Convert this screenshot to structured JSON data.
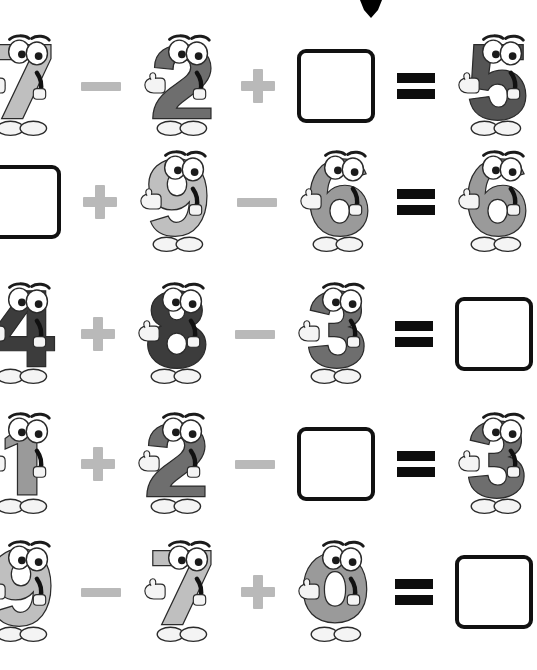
{
  "worksheet": {
    "title": "Number characters addition and subtraction worksheet",
    "background_color": "#ffffff",
    "cursor": {
      "name": "down-triangle-cursor",
      "color": "#000000"
    }
  },
  "symbols": {
    "plus": "+",
    "minus": "−",
    "equals": "=",
    "blank": "",
    "plus_color": "#b9b9b9",
    "minus_color": "#b9b9b9",
    "equals_color": "#0d0d0d",
    "box_border_color": "#111111",
    "box_fill_color": "#ffffff"
  },
  "digit_colors": {
    "light": "#bfbfbf",
    "medium": "#9a9a9a",
    "dark": "#6e6e6e",
    "darker": "#555555",
    "near_black": "#3c3c3c",
    "outline": "#2b2b2b",
    "shoe": "#f4f4f4",
    "hand": "#f4f4f4"
  },
  "chart_data": {
    "type": "table",
    "columns": [
      "operand1",
      "operator1",
      "operand2",
      "operator2",
      "operand3",
      "equals",
      "result"
    ],
    "rows": [
      [
        "7",
        "−",
        "2",
        "+",
        "",
        "=",
        "5"
      ],
      [
        "",
        "+",
        "9",
        "−",
        "6",
        "=",
        "6"
      ],
      [
        "4",
        "+",
        "8",
        "−",
        "3",
        "=",
        ""
      ],
      [
        "1",
        "+",
        "2",
        "−",
        "",
        "=",
        "3"
      ],
      [
        "9",
        "−",
        "7",
        "+",
        "0",
        "=",
        ""
      ]
    ]
  },
  "equations": [
    {
      "index": 1,
      "top": 34,
      "terms": [
        {
          "kind": "digit",
          "value": "7",
          "shade": "light",
          "name": "digit-7"
        },
        {
          "kind": "op",
          "value": "−",
          "name": "minus-operator"
        },
        {
          "kind": "digit",
          "value": "2",
          "shade": "dark",
          "name": "digit-2"
        },
        {
          "kind": "op",
          "value": "+",
          "name": "plus-operator"
        },
        {
          "kind": "box",
          "value": "",
          "name": "answer-box"
        },
        {
          "kind": "op",
          "value": "=",
          "name": "equals-operator"
        },
        {
          "kind": "digit",
          "value": "5",
          "shade": "darker",
          "name": "digit-5"
        }
      ]
    },
    {
      "index": 2,
      "top": 150,
      "terms": [
        {
          "kind": "box",
          "value": "",
          "name": "answer-box"
        },
        {
          "kind": "op",
          "value": "+",
          "name": "plus-operator"
        },
        {
          "kind": "digit",
          "value": "9",
          "shade": "light",
          "name": "digit-9"
        },
        {
          "kind": "op",
          "value": "−",
          "name": "minus-operator"
        },
        {
          "kind": "digit",
          "value": "6",
          "shade": "medium",
          "name": "digit-6"
        },
        {
          "kind": "op",
          "value": "=",
          "name": "equals-operator"
        },
        {
          "kind": "digit",
          "value": "6",
          "shade": "medium",
          "name": "digit-6-result"
        }
      ]
    },
    {
      "index": 3,
      "top": 282,
      "terms": [
        {
          "kind": "digit",
          "value": "4",
          "shade": "near_black",
          "name": "digit-4"
        },
        {
          "kind": "op",
          "value": "+",
          "name": "plus-operator"
        },
        {
          "kind": "digit",
          "value": "8",
          "shade": "near_black",
          "name": "digit-8"
        },
        {
          "kind": "op",
          "value": "−",
          "name": "minus-operator"
        },
        {
          "kind": "digit",
          "value": "3",
          "shade": "dark",
          "name": "digit-3"
        },
        {
          "kind": "op",
          "value": "=",
          "name": "equals-operator"
        },
        {
          "kind": "box",
          "value": "",
          "name": "answer-box"
        }
      ]
    },
    {
      "index": 4,
      "top": 412,
      "terms": [
        {
          "kind": "digit",
          "value": "1",
          "shade": "medium",
          "name": "digit-1"
        },
        {
          "kind": "op",
          "value": "+",
          "name": "plus-operator"
        },
        {
          "kind": "digit",
          "value": "2",
          "shade": "dark",
          "name": "digit-2"
        },
        {
          "kind": "op",
          "value": "−",
          "name": "minus-operator"
        },
        {
          "kind": "box",
          "value": "",
          "name": "answer-box"
        },
        {
          "kind": "op",
          "value": "=",
          "name": "equals-operator"
        },
        {
          "kind": "digit",
          "value": "3",
          "shade": "dark",
          "name": "digit-3-result"
        }
      ]
    },
    {
      "index": 5,
      "top": 540,
      "terms": [
        {
          "kind": "digit",
          "value": "9",
          "shade": "light",
          "name": "digit-9"
        },
        {
          "kind": "op",
          "value": "−",
          "name": "minus-operator"
        },
        {
          "kind": "digit",
          "value": "7",
          "shade": "light",
          "name": "digit-7"
        },
        {
          "kind": "op",
          "value": "+",
          "name": "plus-operator"
        },
        {
          "kind": "digit",
          "value": "0",
          "shade": "medium",
          "name": "digit-0"
        },
        {
          "kind": "op",
          "value": "=",
          "name": "equals-operator"
        },
        {
          "kind": "box",
          "value": "",
          "name": "answer-box"
        }
      ]
    }
  ]
}
